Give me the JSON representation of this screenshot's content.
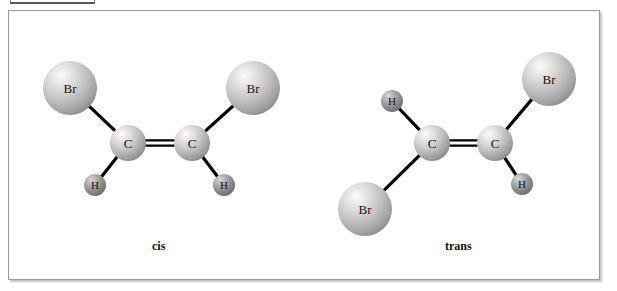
{
  "figure": {
    "caption_cis": "cis",
    "caption_trans": "trans",
    "top_fragment_text": "",
    "colors": {
      "frame_border": "#9a9a9a",
      "page_background": "#ffffff",
      "bond_stroke": "#000000",
      "atom_label": "#151515",
      "large_sphere_light": "#f2f2f2",
      "large_sphere_mid": "#c6c6c6",
      "large_sphere_dark": "#8e8e8e",
      "small_sphere_light": "#cfcfcf",
      "small_sphere_mid": "#9a9a9a",
      "small_sphere_dark": "#6b6b6b"
    }
  },
  "molecules": [
    {
      "id": "cis",
      "name": "cis",
      "atoms": [
        {
          "id": "cis-br-left",
          "element": "Br",
          "label": "Br",
          "cx": 70,
          "cy": 88,
          "r": 27,
          "size": "large"
        },
        {
          "id": "cis-br-right",
          "element": "Br",
          "label": "Br",
          "cx": 253,
          "cy": 88,
          "r": 27,
          "size": "large"
        },
        {
          "id": "cis-c-left",
          "element": "C",
          "label": "C",
          "cx": 128,
          "cy": 143,
          "r": 18,
          "size": "medium"
        },
        {
          "id": "cis-c-right",
          "element": "C",
          "label": "C",
          "cx": 192,
          "cy": 143,
          "r": 18,
          "size": "medium"
        },
        {
          "id": "cis-h-left",
          "element": "H",
          "label": "H",
          "cx": 95,
          "cy": 185,
          "r": 11,
          "size": "small"
        },
        {
          "id": "cis-h-right",
          "element": "H",
          "label": "H",
          "cx": 224,
          "cy": 185,
          "r": 11,
          "size": "small"
        }
      ],
      "bonds": [
        {
          "from": "cis-br-left",
          "to": "cis-c-left",
          "order": 1
        },
        {
          "from": "cis-br-right",
          "to": "cis-c-right",
          "order": 1
        },
        {
          "from": "cis-c-left",
          "to": "cis-c-right",
          "order": 2
        },
        {
          "from": "cis-c-left",
          "to": "cis-h-left",
          "order": 1
        },
        {
          "from": "cis-c-right",
          "to": "cis-h-right",
          "order": 1
        }
      ]
    },
    {
      "id": "trans",
      "name": "trans",
      "atoms": [
        {
          "id": "trans-h-top",
          "element": "H",
          "label": "H",
          "cx": 392,
          "cy": 101,
          "r": 11,
          "size": "small"
        },
        {
          "id": "trans-br-bottom",
          "element": "Br",
          "label": "Br",
          "cx": 365,
          "cy": 209,
          "r": 27,
          "size": "large"
        },
        {
          "id": "trans-c-left",
          "element": "C",
          "label": "C",
          "cx": 432,
          "cy": 143,
          "r": 18,
          "size": "medium"
        },
        {
          "id": "trans-c-right",
          "element": "C",
          "label": "C",
          "cx": 495,
          "cy": 143,
          "r": 18,
          "size": "medium"
        },
        {
          "id": "trans-br-top",
          "element": "Br",
          "label": "Br",
          "cx": 549,
          "cy": 79,
          "r": 27,
          "size": "large"
        },
        {
          "id": "trans-h-bottom",
          "element": "H",
          "label": "H",
          "cx": 522,
          "cy": 184,
          "r": 11,
          "size": "small"
        }
      ],
      "bonds": [
        {
          "from": "trans-h-top",
          "to": "trans-c-left",
          "order": 1
        },
        {
          "from": "trans-br-bottom",
          "to": "trans-c-left",
          "order": 1
        },
        {
          "from": "trans-c-left",
          "to": "trans-c-right",
          "order": 2
        },
        {
          "from": "trans-c-right",
          "to": "trans-br-top",
          "order": 1
        },
        {
          "from": "trans-c-right",
          "to": "trans-h-bottom",
          "order": 1
        }
      ]
    }
  ]
}
